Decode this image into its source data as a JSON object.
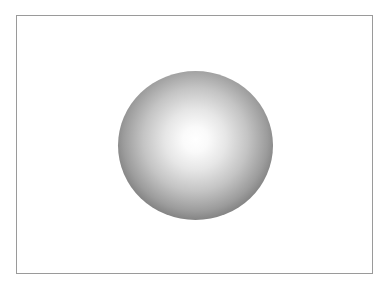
{
  "scene": {
    "description": "Shaded grey sphere centered in a thin-bordered rectangular frame",
    "frame": {
      "border_color": "#9a9a9a",
      "background": "#ffffff"
    },
    "sphere": {
      "highlight_color": "#ffffff",
      "edge_color": "#6c6c6c"
    }
  }
}
